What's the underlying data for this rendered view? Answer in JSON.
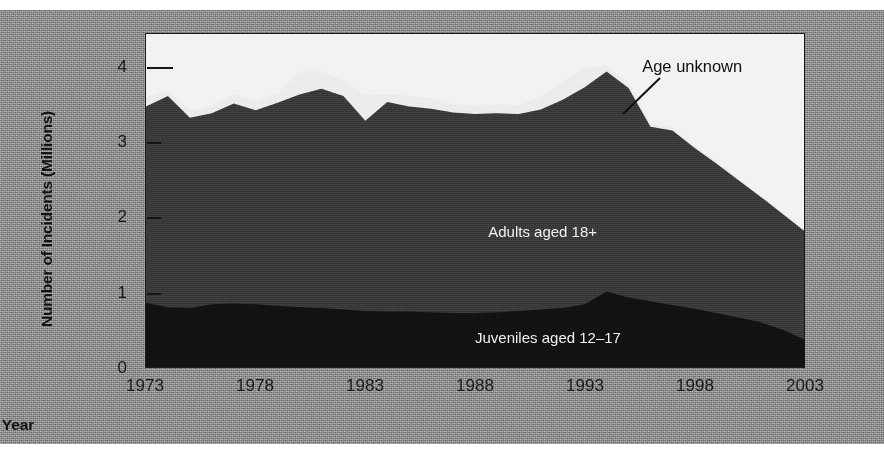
{
  "figure": {
    "y_axis_title": "Number of Incidents (Millions)",
    "x_axis_title": "Year",
    "callout": "Age unknown",
    "label_adults": "Adults aged 18+",
    "label_juveniles": "Juveniles aged 12–17",
    "colors": {
      "matte": "#8e8e8e",
      "plot_background": "#f2f2f2",
      "age_unknown": "#ececec",
      "adults": "#3a3a3a",
      "juveniles": "#121212",
      "axis": "#1b1b1b",
      "text": "#1a1a1a"
    }
  },
  "chart_data": {
    "type": "area",
    "title": "",
    "subtitle": "",
    "xlabel": "Year",
    "ylabel": "Number of Incidents (Millions)",
    "stacked": true,
    "grid": false,
    "legend_position": "inline-annotations",
    "xlim": [
      1973,
      2003
    ],
    "ylim": [
      0,
      4.45
    ],
    "yticks": [
      0,
      1,
      2,
      3,
      4
    ],
    "ytick_labels": [
      "0",
      "1",
      "2",
      "3",
      "4"
    ],
    "xticks": [
      1973,
      1978,
      1983,
      1988,
      1993,
      1998,
      2003
    ],
    "xtick_labels": [
      "1973",
      "1978",
      "1983",
      "1988",
      "1993",
      "1998",
      "2003"
    ],
    "x": [
      1973,
      1974,
      1975,
      1976,
      1977,
      1978,
      1979,
      1980,
      1981,
      1982,
      1983,
      1984,
      1985,
      1986,
      1987,
      1988,
      1989,
      1990,
      1991,
      1992,
      1993,
      1994,
      1995,
      1996,
      1997,
      1998,
      1999,
      2000,
      2001,
      2002,
      2003
    ],
    "series": [
      {
        "name": "Juveniles aged 12–17",
        "color": "#121212",
        "values": [
          0.86,
          0.8,
          0.79,
          0.84,
          0.85,
          0.84,
          0.82,
          0.8,
          0.79,
          0.77,
          0.75,
          0.74,
          0.74,
          0.73,
          0.72,
          0.72,
          0.73,
          0.75,
          0.77,
          0.79,
          0.84,
          1.01,
          0.93,
          0.88,
          0.83,
          0.78,
          0.72,
          0.66,
          0.6,
          0.5,
          0.37
        ]
      },
      {
        "name": "Adults aged 18+",
        "color": "#3a3a3a",
        "values": [
          2.62,
          2.82,
          2.54,
          2.55,
          2.67,
          2.59,
          2.71,
          2.84,
          2.93,
          2.85,
          2.54,
          2.8,
          2.74,
          2.72,
          2.68,
          2.66,
          2.66,
          2.63,
          2.67,
          2.78,
          2.9,
          2.94,
          2.8,
          2.33,
          2.33,
          2.15,
          2.0,
          1.84,
          1.68,
          1.55,
          1.45
        ]
      },
      {
        "name": "Age unknown",
        "color": "#ececec",
        "values": [
          0.12,
          0.09,
          0.1,
          0.11,
          0.12,
          0.13,
          0.12,
          0.31,
          0.23,
          0.22,
          0.34,
          0.11,
          0.14,
          0.14,
          0.11,
          0.11,
          0.12,
          0.12,
          0.18,
          0.23,
          0.26,
          0.08,
          0.07,
          0.05,
          0.04,
          0.03,
          0.03,
          0.02,
          0.02,
          0.02,
          0.02
        ]
      }
    ]
  }
}
